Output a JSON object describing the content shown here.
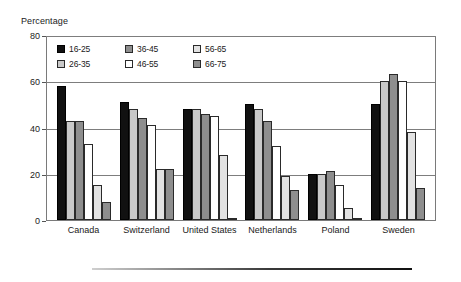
{
  "chart_data": {
    "type": "bar",
    "title": "",
    "subtitle": "",
    "xlabel": "",
    "ylabel": "Percentage",
    "ylim": [
      0,
      80
    ],
    "yticks": [
      0,
      20,
      40,
      60,
      80
    ],
    "ytick_labels": [
      "0",
      "20",
      "40",
      "60",
      "80"
    ],
    "grid": true,
    "gridlines_at": [
      20,
      40,
      60,
      80
    ],
    "legend_position": "inside-top",
    "legend_title": "",
    "categories": [
      "Canada",
      "Switzerland",
      "United States",
      "Netherlands",
      "Poland",
      "Sweden"
    ],
    "series": [
      {
        "name": "16-25",
        "fill": "black",
        "color": "#111111",
        "values": [
          58,
          51,
          48,
          50,
          20,
          50
        ]
      },
      {
        "name": "26-35",
        "fill": "light-gray",
        "color": "#c9c9c9",
        "values": [
          43,
          48,
          48,
          48,
          20,
          60
        ]
      },
      {
        "name": "36-45",
        "fill": "medium-gray",
        "color": "#8e8e8e",
        "values": [
          43,
          44,
          46,
          43,
          21,
          63
        ]
      },
      {
        "name": "46-55",
        "fill": "white",
        "color": "#ffffff",
        "values": [
          33,
          41,
          45,
          32,
          15,
          60
        ]
      },
      {
        "name": "56-65",
        "fill": "very-light-gray",
        "color": "#e2e2e2",
        "values": [
          15,
          22,
          28,
          19,
          5,
          38
        ]
      },
      {
        "name": "66-75",
        "fill": "medium-gray",
        "color": "#8e8e8e",
        "values": [
          8,
          22,
          1,
          13,
          1,
          14
        ]
      }
    ]
  }
}
